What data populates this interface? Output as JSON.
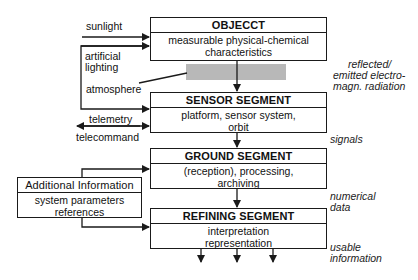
{
  "diagram": {
    "boxes": [
      {
        "id": "object",
        "title": "OBJECCT",
        "body": [
          "measurable physical-chemical",
          "characteristics"
        ]
      },
      {
        "id": "sensor",
        "title": "SENSOR SEGMENT",
        "body": [
          "platform, sensor system,",
          "orbit"
        ]
      },
      {
        "id": "ground",
        "title": "GROUND SEGMENT",
        "body": [
          "(reception), processing,",
          "archiving"
        ]
      },
      {
        "id": "refining",
        "title": "REFINING SEGMENT",
        "body": [
          "interpretation",
          "representation"
        ]
      }
    ],
    "additional_info": {
      "title": "Additional Information",
      "body": [
        "system parameters",
        "references"
      ]
    },
    "left_labels": {
      "sunlight": "sunlight",
      "artificial": "artificial",
      "lighting": "lighting",
      "atmosphere": "atmosphere",
      "telemetry": "telemetry",
      "telecommand": "telecommand"
    },
    "right_labels": {
      "radiation_1": "reflected/",
      "radiation_2": "emitted electro-",
      "radiation_3": "magn. radiation",
      "signals": "signals",
      "numerical_1": "numerical",
      "numerical_2": "data",
      "usable_1": "usable",
      "usable_2": "information"
    },
    "colors": {
      "line": "#1a1a1a",
      "atmosphere_band": "#b8b8b8"
    }
  }
}
